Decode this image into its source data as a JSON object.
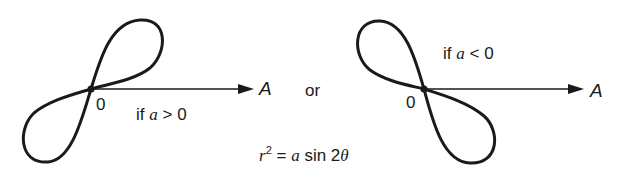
{
  "diagram": {
    "type": "lemniscate-polar-curves",
    "left": {
      "origin_label": "0",
      "axis_label": "A",
      "condition_prefix": "if",
      "condition_var": "a",
      "condition_op": ">",
      "condition_val": "0"
    },
    "connector": "or",
    "right": {
      "origin_label": "0",
      "axis_label": "A",
      "condition_prefix": "if",
      "condition_var": "a",
      "condition_op": "<",
      "condition_val": "0"
    },
    "equation": {
      "lhs_var": "r",
      "lhs_exp": "2",
      "eq": "=",
      "rhs_var": "a",
      "rhs_func": "sin 2",
      "rhs_angle": "θ"
    },
    "colors": {
      "stroke": "#1a1a1a",
      "background": "#ffffff"
    }
  }
}
